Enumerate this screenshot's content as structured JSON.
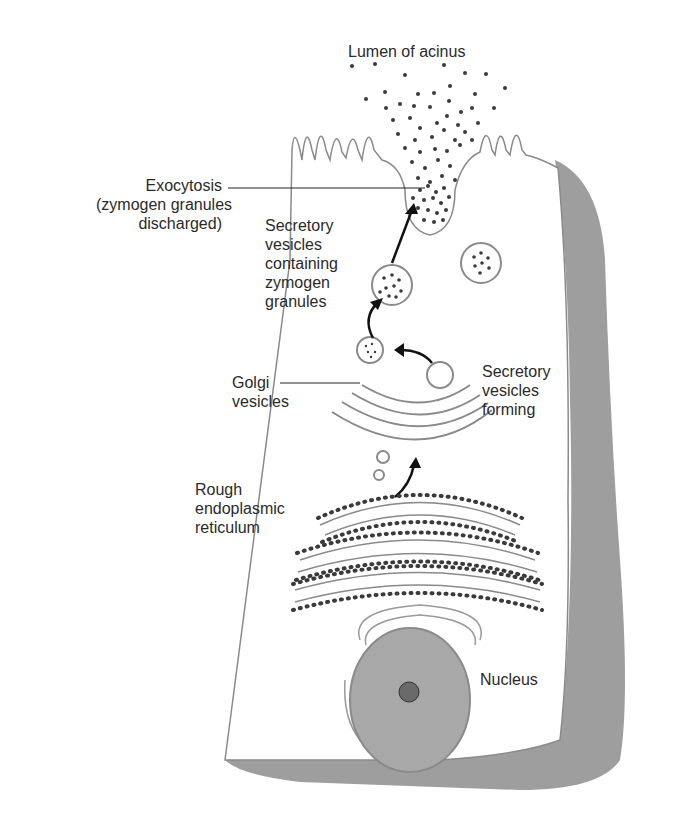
{
  "labels": {
    "lumen": "Lumen of acinus",
    "exocytosis": [
      "Exocytosis",
      "(zymogen granules",
      "discharged)"
    ],
    "secretory_vesicles": [
      "Secretory",
      "vesicles",
      "containing",
      "zymogen",
      "granules"
    ],
    "golgi": [
      "Golgi",
      "vesicles"
    ],
    "forming": [
      "Secretory",
      "vesicles",
      "forming"
    ],
    "rer": [
      "Rough",
      "endoplasmic",
      "reticulum"
    ],
    "nucleus": "Nucleus"
  },
  "colors": {
    "outline": "#8a8a8a",
    "shadow": "#9e9e9e",
    "nucleus": "#a8a8a8",
    "granule": "#3a3a3a",
    "text": "#2a2a2a"
  }
}
